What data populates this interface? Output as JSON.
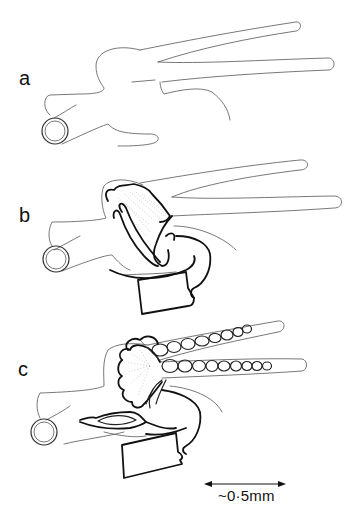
{
  "figure": {
    "panels": [
      {
        "id": "a",
        "label": "a",
        "description": "Outline of tubular body with two long parallel projections and cross-sectioned tube; no internal structures"
      },
      {
        "id": "b",
        "label": "b",
        "description": "Same outline with developing folded/stippled mass and thick-outlined structure below"
      },
      {
        "id": "c",
        "label": "c",
        "description": "Same outline with two chains of beaded segments extending into projections and lobed structure below"
      }
    ],
    "scale_bar": {
      "label": "~0·5mm",
      "arrow": "double-headed"
    },
    "colors": {
      "background": "#ffffff",
      "line": "#111111",
      "thin_line": "#555555"
    }
  }
}
